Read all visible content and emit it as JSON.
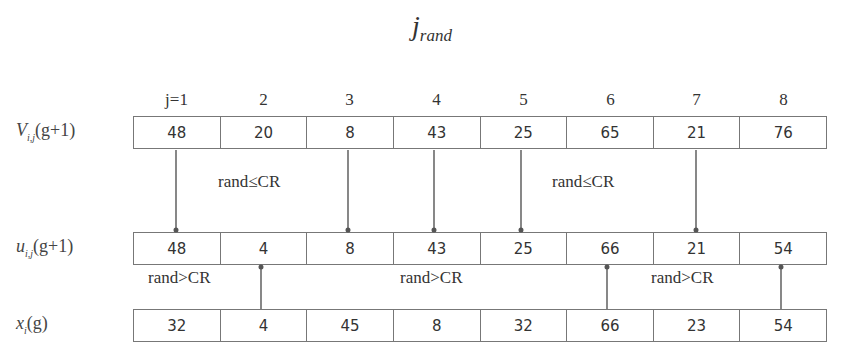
{
  "title": {
    "main": "j",
    "subscript": "rand"
  },
  "column_indices": [
    "j=1",
    "2",
    "3",
    "4",
    "5",
    "6",
    "7",
    "8"
  ],
  "rows": [
    {
      "id": "v",
      "label_main": "V",
      "label_sub": "i,j",
      "label_tail": "(g+1)",
      "values": [
        "48",
        "20",
        "8",
        "43",
        "25",
        "65",
        "21",
        "76"
      ]
    },
    {
      "id": "u",
      "label_main": "u",
      "label_sub": "i,j",
      "label_tail": "(g+1)",
      "values": [
        "48",
        "4",
        "8",
        "43",
        "25",
        "66",
        "21",
        "54"
      ]
    },
    {
      "id": "x",
      "label_main": "x",
      "label_sub": "i",
      "label_tail": "(g)",
      "values": [
        "32",
        "4",
        "45",
        "8",
        "32",
        "66",
        "23",
        "54"
      ]
    }
  ],
  "conditions": {
    "upper": [
      "rand≤CR",
      "rand≤CR"
    ],
    "lower": [
      "rand>CR",
      "rand>CR",
      "rand>CR"
    ]
  },
  "arrows": {
    "from_v_to_u_columns": [
      1,
      3,
      4,
      5,
      7
    ],
    "from_x_to_u_columns": [
      2,
      6,
      8
    ]
  },
  "colors": {
    "line": "#555555",
    "text": "#333333"
  }
}
